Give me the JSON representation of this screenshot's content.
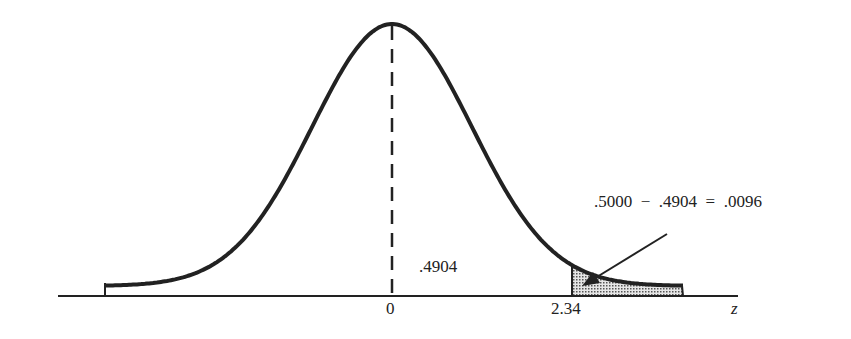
{
  "diagram": {
    "type": "normal-distribution-curve",
    "center_label": "0",
    "z_value_label": "2.34",
    "axis_label": "z",
    "area_label": ".4904",
    "tail_equation": ".5000  −  .4904  =  .0096",
    "colors": {
      "stroke": "#222222",
      "shade": "#bdbdbd"
    }
  },
  "chart_data": {
    "type": "area",
    "title": "",
    "xlabel": "z",
    "ylabel": "",
    "x_ticks": [
      "0",
      "2.34"
    ],
    "shaded_region": {
      "from_z": 2.34,
      "to_z": "right tail",
      "area": 0.0096
    },
    "annotations": [
      {
        "text": ".4904",
        "meaning": "area between 0 and 2.34"
      },
      {
        "text": ".5000 − .4904 = .0096",
        "meaning": "tail area beyond z = 2.34"
      }
    ]
  }
}
